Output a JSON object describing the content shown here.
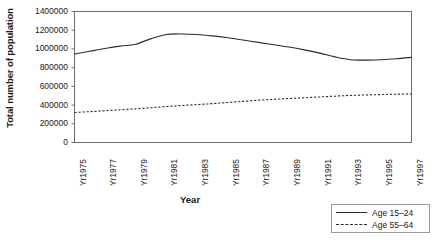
{
  "chart_data": {
    "type": "line",
    "title": "",
    "xlabel": "Year",
    "ylabel": "Total number of population",
    "ylim": [
      0,
      1400000
    ],
    "yticks": [
      0,
      200000,
      400000,
      600000,
      800000,
      1000000,
      1200000,
      1400000
    ],
    "ytick_labels": [
      "0",
      "200000",
      "400000",
      "600000",
      "800000",
      "1000000",
      "1200000",
      "1400000"
    ],
    "grid": false,
    "legend_position": "bottom-right",
    "x": [
      1975,
      1976,
      1977,
      1978,
      1979,
      1980,
      1981,
      1982,
      1983,
      1984,
      1985,
      1986,
      1987,
      1988,
      1989,
      1990,
      1991,
      1992,
      1993,
      1994,
      1995,
      1996,
      1997
    ],
    "xtick_labels": [
      "Yr1975",
      "Yr1977",
      "Yr1979",
      "Yr1981",
      "Yr1983",
      "Yr1985",
      "Yr1987",
      "Yr1989",
      "Yr1991",
      "Yr1993",
      "Yr1995",
      "Yr1997"
    ],
    "xtick_values": [
      1975,
      1977,
      1979,
      1981,
      1983,
      1985,
      1987,
      1989,
      1991,
      1993,
      1995,
      1997
    ],
    "series": [
      {
        "name": "Age 15–24",
        "style": "solid",
        "color": "#2b2b2b",
        "values": [
          945000,
          975000,
          1005000,
          1030000,
          1050000,
          1110000,
          1155000,
          1160000,
          1155000,
          1140000,
          1120000,
          1095000,
          1070000,
          1045000,
          1020000,
          990000,
          955000,
          915000,
          885000,
          880000,
          885000,
          895000,
          910000
        ]
      },
      {
        "name": "Age 55–64",
        "style": "dashed",
        "color": "#2b2b2b",
        "values": [
          320000,
          330000,
          340000,
          350000,
          360000,
          372000,
          385000,
          395000,
          405000,
          415000,
          428000,
          440000,
          452000,
          462000,
          470000,
          478000,
          487000,
          495000,
          503000,
          508000,
          512000,
          516000,
          520000
        ]
      }
    ]
  },
  "legend": {
    "entries": [
      {
        "label": "Age 15–24",
        "style": "solid"
      },
      {
        "label": "Age 55–64",
        "style": "dashed"
      }
    ]
  }
}
